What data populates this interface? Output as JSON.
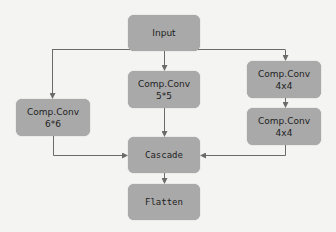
{
  "diagram": {
    "colors": {
      "node_fill": "#a9a9a9",
      "edge": "#6b6b6b",
      "background": "#f4f4f2",
      "text": "#1e1e1e"
    },
    "nodes": {
      "input": {
        "label": "Input"
      },
      "conv5": {
        "label": "Comp.Conv",
        "size": "5*5"
      },
      "conv6": {
        "label": "Comp.Conv",
        "size": "6*6"
      },
      "conv4a": {
        "label": "Comp.Conv",
        "size": "4x4"
      },
      "conv4b": {
        "label": "Comp.Conv",
        "size": "4x4"
      },
      "cascade": {
        "label": "Cascade"
      },
      "flatten": {
        "label": "Flatten"
      }
    },
    "edges": [
      {
        "from": "input",
        "to": "conv6"
      },
      {
        "from": "input",
        "to": "conv5"
      },
      {
        "from": "input",
        "to": "conv4a"
      },
      {
        "from": "conv4a",
        "to": "conv4b"
      },
      {
        "from": "conv6",
        "to": "cascade"
      },
      {
        "from": "conv5",
        "to": "cascade"
      },
      {
        "from": "conv4b",
        "to": "cascade"
      },
      {
        "from": "cascade",
        "to": "flatten"
      }
    ]
  }
}
